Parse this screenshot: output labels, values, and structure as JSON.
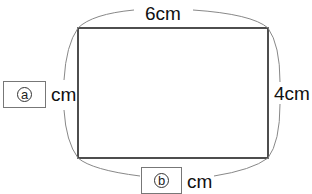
{
  "diagram": {
    "type": "rectangle-dimensions",
    "top_label": "6cm",
    "right_label": "4cm",
    "left": {
      "blank_marker": "ⓐ",
      "marker_letter": "a",
      "unit": "cm"
    },
    "bottom": {
      "blank_marker": "ⓑ",
      "marker_letter": "b",
      "unit": "cm"
    },
    "colors": {
      "rect_stroke": "#222222",
      "brace_stroke": "#888888",
      "box_border": "#777777"
    }
  }
}
